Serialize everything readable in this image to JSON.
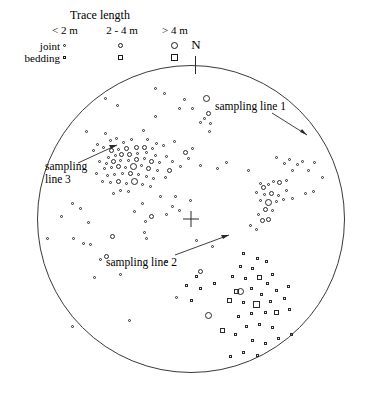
{
  "legend": {
    "title": "Trace length",
    "columns": [
      "< 2 m",
      "2 - 4 m",
      "> 4 m"
    ],
    "rows": [
      {
        "label": "joint",
        "shape": "circle"
      },
      {
        "label": "bedding",
        "shape": "square"
      }
    ],
    "sizes": [
      3,
      5,
      7
    ]
  },
  "orientation": {
    "north_label": "N"
  },
  "annotations": [
    {
      "id": "sampling-line-1",
      "lines": [
        "sampling line 1"
      ]
    },
    {
      "id": "sampling-line-2",
      "lines": [
        "sampling line 2"
      ]
    },
    {
      "id": "sampling-line-3",
      "lines": [
        "sampling",
        "line 3"
      ]
    }
  ],
  "chart_data": {
    "type": "scatter",
    "title": "",
    "projection": "equal-area lower-hemisphere stereonet",
    "circle": {
      "cx": 191,
      "cy": 219,
      "r": 154
    },
    "xlabel": "",
    "ylabel": "",
    "legend_position": "top-left",
    "grid": false,
    "marker_size_classes": {
      "< 2 m": 3,
      "2 - 4 m": 5,
      "> 4 m": 7
    },
    "series": [
      {
        "name": "joint",
        "shape": "circle",
        "count": 152,
        "points": [
          [
            155,
            88,
            3
          ],
          [
            105,
            98,
            3
          ],
          [
            164,
            93,
            3
          ],
          [
            184,
            99,
            3
          ],
          [
            206,
            98,
            7
          ],
          [
            179,
            108,
            3
          ],
          [
            192,
            108,
            3
          ],
          [
            117,
            105,
            3
          ],
          [
            155,
            116,
            3
          ],
          [
            208,
            113,
            5
          ],
          [
            204,
            118,
            3
          ],
          [
            210,
            123,
            3
          ],
          [
            200,
            122,
            3
          ],
          [
            209,
            131,
            3
          ],
          [
            86,
            131,
            3
          ],
          [
            105,
            133,
            3
          ],
          [
            143,
            130,
            3
          ],
          [
            110,
            140,
            3
          ],
          [
            116,
            138,
            3
          ],
          [
            147,
            139,
            3
          ],
          [
            97,
            144,
            3
          ],
          [
            103,
            147,
            3
          ],
          [
            123,
            142,
            3
          ],
          [
            131,
            139,
            3
          ],
          [
            156,
            143,
            3
          ],
          [
            174,
            141,
            3
          ],
          [
            93,
            150,
            3
          ],
          [
            111,
            150,
            5
          ],
          [
            118,
            149,
            3
          ],
          [
            126,
            148,
            5
          ],
          [
            136,
            147,
            5
          ],
          [
            144,
            147,
            5
          ],
          [
            152,
            148,
            3
          ],
          [
            163,
            145,
            3
          ],
          [
            192,
            148,
            3
          ],
          [
            108,
            157,
            3
          ],
          [
            115,
            155,
            3
          ],
          [
            121,
            154,
            5
          ],
          [
            129,
            154,
            5
          ],
          [
            137,
            153,
            3
          ],
          [
            146,
            152,
            3
          ],
          [
            155,
            155,
            3
          ],
          [
            166,
            156,
            3
          ],
          [
            185,
            152,
            5
          ],
          [
            188,
            158,
            3
          ],
          [
            99,
            161,
            3
          ],
          [
            106,
            163,
            3
          ],
          [
            113,
            161,
            5
          ],
          [
            120,
            160,
            3
          ],
          [
            128,
            160,
            3
          ],
          [
            136,
            159,
            5
          ],
          [
            144,
            158,
            3
          ],
          [
            151,
            161,
            5
          ],
          [
            159,
            162,
            3
          ],
          [
            172,
            161,
            3
          ],
          [
            180,
            166,
            3
          ],
          [
            104,
            168,
            3
          ],
          [
            111,
            167,
            3
          ],
          [
            118,
            166,
            5
          ],
          [
            125,
            167,
            3
          ],
          [
            133,
            166,
            7
          ],
          [
            141,
            165,
            3
          ],
          [
            148,
            168,
            5
          ],
          [
            157,
            170,
            3
          ],
          [
            169,
            170,
            5
          ],
          [
            96,
            173,
            3
          ],
          [
            107,
            175,
            3
          ],
          [
            114,
            174,
            3
          ],
          [
            122,
            173,
            3
          ],
          [
            130,
            173,
            5
          ],
          [
            138,
            174,
            3
          ],
          [
            146,
            176,
            3
          ],
          [
            153,
            178,
            3
          ],
          [
            165,
            177,
            3
          ],
          [
            102,
            181,
            3
          ],
          [
            110,
            182,
            3
          ],
          [
            118,
            181,
            5
          ],
          [
            126,
            183,
            3
          ],
          [
            134,
            181,
            7
          ],
          [
            142,
            184,
            3
          ],
          [
            150,
            186,
            3
          ],
          [
            120,
            190,
            3
          ],
          [
            128,
            191,
            3
          ],
          [
            113,
            193,
            3
          ],
          [
            200,
            165,
            3
          ],
          [
            217,
            168,
            3
          ],
          [
            226,
            162,
            3
          ],
          [
            248,
            170,
            3
          ],
          [
            276,
            157,
            3
          ],
          [
            284,
            163,
            3
          ],
          [
            289,
            159,
            3
          ],
          [
            297,
            164,
            3
          ],
          [
            302,
            161,
            3
          ],
          [
            292,
            170,
            3
          ],
          [
            308,
            170,
            3
          ],
          [
            314,
            162,
            3
          ],
          [
            322,
            177,
            3
          ],
          [
            260,
            183,
            3
          ],
          [
            263,
            187,
            5
          ],
          [
            268,
            184,
            3
          ],
          [
            273,
            181,
            3
          ],
          [
            279,
            182,
            5
          ],
          [
            286,
            180,
            3
          ],
          [
            256,
            192,
            3
          ],
          [
            264,
            194,
            3
          ],
          [
            271,
            193,
            5
          ],
          [
            278,
            195,
            3
          ],
          [
            286,
            190,
            3
          ],
          [
            260,
            200,
            3
          ],
          [
            268,
            202,
            7
          ],
          [
            276,
            201,
            3
          ],
          [
            283,
            199,
            3
          ],
          [
            292,
            198,
            3
          ],
          [
            265,
            209,
            5
          ],
          [
            272,
            210,
            3
          ],
          [
            258,
            214,
            3
          ],
          [
            262,
            220,
            5
          ],
          [
            268,
            219,
            5
          ],
          [
            250,
            225,
            3
          ],
          [
            256,
            229,
            3
          ],
          [
            305,
            193,
            3
          ],
          [
            313,
            191,
            3
          ],
          [
            160,
            196,
            3
          ],
          [
            175,
            196,
            3
          ],
          [
            190,
            200,
            3
          ],
          [
            172,
            206,
            3
          ],
          [
            179,
            210,
            3
          ],
          [
            166,
            214,
            3
          ],
          [
            142,
            203,
            3
          ],
          [
            134,
            211,
            3
          ],
          [
            151,
            216,
            5
          ],
          [
            145,
            221,
            3
          ],
          [
            72,
            203,
            3
          ],
          [
            80,
            208,
            3
          ],
          [
            61,
            216,
            3
          ],
          [
            88,
            222,
            3
          ],
          [
            47,
            238,
            3
          ],
          [
            73,
            238,
            3
          ],
          [
            83,
            243,
            3
          ],
          [
            90,
            244,
            3
          ],
          [
            112,
            236,
            5
          ],
          [
            144,
            232,
            3
          ],
          [
            146,
            238,
            3
          ],
          [
            196,
            240,
            3
          ],
          [
            212,
            246,
            3
          ],
          [
            100,
            259,
            3
          ],
          [
            106,
            256,
            5
          ],
          [
            166,
            261,
            3
          ],
          [
            120,
            274,
            3
          ],
          [
            200,
            271,
            5
          ],
          [
            94,
            277,
            3
          ],
          [
            176,
            297,
            3
          ],
          [
            208,
            315,
            7
          ],
          [
            240,
            291,
            7
          ],
          [
            72,
            326,
            3
          ],
          [
            129,
            320,
            3
          ]
        ]
      },
      {
        "name": "bedding",
        "shape": "square",
        "count": 42,
        "points": [
          [
            243,
            253,
            3
          ],
          [
            257,
            258,
            3
          ],
          [
            266,
            261,
            3
          ],
          [
            252,
            268,
            3
          ],
          [
            240,
            266,
            3
          ],
          [
            232,
            276,
            3
          ],
          [
            245,
            278,
            3
          ],
          [
            259,
            277,
            5
          ],
          [
            272,
            274,
            3
          ],
          [
            267,
            283,
            3
          ],
          [
            251,
            288,
            3
          ],
          [
            236,
            291,
            5
          ],
          [
            261,
            294,
            3
          ],
          [
            276,
            290,
            3
          ],
          [
            288,
            286,
            3
          ],
          [
            229,
            300,
            5
          ],
          [
            243,
            302,
            3
          ],
          [
            256,
            304,
            7
          ],
          [
            270,
            301,
            3
          ],
          [
            284,
            298,
            3
          ],
          [
            251,
            313,
            3
          ],
          [
            265,
            312,
            3
          ],
          [
            238,
            316,
            3
          ],
          [
            276,
            312,
            5
          ],
          [
            289,
            309,
            3
          ],
          [
            246,
            326,
            3
          ],
          [
            259,
            324,
            3
          ],
          [
            272,
            327,
            3
          ],
          [
            222,
            330,
            5
          ],
          [
            235,
            334,
            3
          ],
          [
            252,
            340,
            3
          ],
          [
            265,
            343,
            3
          ],
          [
            278,
            338,
            3
          ],
          [
            291,
            334,
            3
          ],
          [
            243,
            352,
            3
          ],
          [
            257,
            355,
            3
          ],
          [
            230,
            356,
            3
          ],
          [
            196,
            276,
            3
          ],
          [
            186,
            285,
            3
          ],
          [
            200,
            288,
            3
          ],
          [
            214,
            283,
            3
          ],
          [
            191,
            300,
            3
          ]
        ]
      }
    ]
  }
}
